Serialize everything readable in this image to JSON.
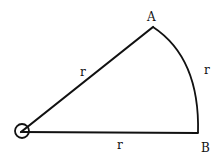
{
  "diagram": {
    "type": "circular-sector",
    "center": {
      "label": "",
      "x": 21,
      "y": 132
    },
    "points": {
      "A": {
        "label": "A",
        "x": 153,
        "y": 27
      },
      "B": {
        "label": "B",
        "x": 198,
        "y": 133
      }
    },
    "labels": {
      "radius_OA": "r",
      "arc_AB": "r",
      "radius_OB": "r"
    },
    "stroke_color": "#111111"
  }
}
